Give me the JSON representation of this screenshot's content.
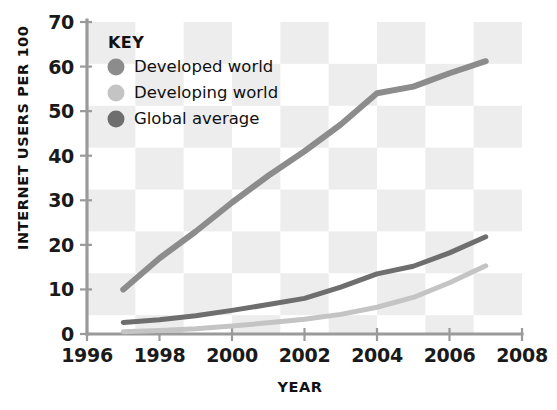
{
  "chart_data": {
    "type": "line",
    "title": "",
    "subtitle": "",
    "xlabel": "YEAR",
    "ylabel": "INTERNET USERS PER 100",
    "xlim": [
      1996,
      2008
    ],
    "ylim": [
      0,
      70
    ],
    "xticks": [
      1996,
      1998,
      2000,
      2002,
      2004,
      2006,
      2008
    ],
    "xtick_labels": [
      "1996",
      "1998",
      "2000",
      "2002",
      "2004",
      "2006",
      "2008"
    ],
    "yticks": [
      0,
      10,
      20,
      30,
      40,
      50,
      60,
      70
    ],
    "ytick_labels": [
      "0",
      "10",
      "20",
      "30",
      "40",
      "50",
      "60",
      "70"
    ],
    "grid": "checkerboard",
    "legend_position": "top-left",
    "legend_title": "KEY",
    "x": [
      1997,
      1998,
      1999,
      2000,
      2001,
      2002,
      2003,
      2004,
      2005,
      2006,
      2007
    ],
    "series": [
      {
        "name": "Developed world",
        "color": "#8c8c8c",
        "values": [
          10.0,
          17.0,
          23.0,
          29.5,
          35.5,
          41.0,
          47.0,
          54.0,
          55.5,
          58.5,
          61.2
        ]
      },
      {
        "name": "Developing world",
        "color": "#c4c4c4",
        "values": [
          0.5,
          0.8,
          1.2,
          1.8,
          2.5,
          3.3,
          4.4,
          6.0,
          8.2,
          11.5,
          15.3
        ]
      },
      {
        "name": "Global average",
        "color": "#6e6e6e",
        "values": [
          2.6,
          3.2,
          4.1,
          5.3,
          6.6,
          8.0,
          10.5,
          13.5,
          15.2,
          18.2,
          21.8
        ]
      }
    ]
  },
  "legend": {
    "title": "KEY",
    "items": [
      {
        "label": "Developed world",
        "color": "#8c8c8c"
      },
      {
        "label": "Developing world",
        "color": "#c4c4c4"
      },
      {
        "label": "Global average",
        "color": "#6e6e6e"
      }
    ]
  },
  "axes": {
    "y_title": "INTERNET USERS PER 100",
    "x_title": "YEAR"
  },
  "colors": {
    "axis": "#9a9a9a",
    "text": "#111111",
    "block": "#ededed",
    "background": "#ffffff"
  }
}
